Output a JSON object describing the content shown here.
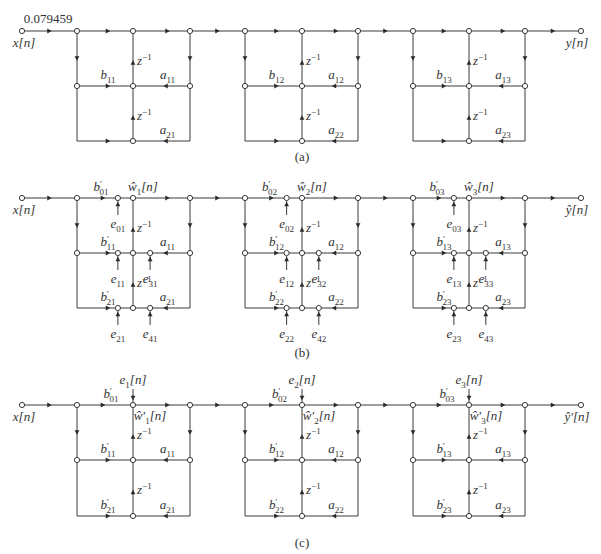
{
  "diagram": {
    "panels": [
      {
        "id": "a",
        "caption": "(a)",
        "input_label": "x[n]",
        "output_label": "y[n]",
        "gain_label": "0.079459",
        "delay_label": "z",
        "delay_exp": "−1",
        "sections": [
          {
            "b_top": null,
            "b1": {
              "base": "b",
              "sub": "11",
              "prime": false
            },
            "a1": {
              "base": "a",
              "sub": "11"
            },
            "b2": null,
            "a2": {
              "base": "a",
              "sub": "21"
            }
          },
          {
            "b_top": null,
            "b1": {
              "base": "b",
              "sub": "12",
              "prime": false
            },
            "a1": {
              "base": "a",
              "sub": "12"
            },
            "b2": null,
            "a2": {
              "base": "a",
              "sub": "22"
            }
          },
          {
            "b_top": null,
            "b1": {
              "base": "b",
              "sub": "13",
              "prime": false
            },
            "a1": {
              "base": "a",
              "sub": "13"
            },
            "b2": null,
            "a2": {
              "base": "a",
              "sub": "23"
            }
          }
        ]
      },
      {
        "id": "b",
        "caption": "(b)",
        "input_label": "x[n]",
        "output_label": "ŷ[n]",
        "delay_label": "z",
        "delay_exp": "−1",
        "sections": [
          {
            "b0": {
              "base": "b",
              "sub": "01",
              "prime": true
            },
            "w": {
              "base": "ŵ",
              "sub": "1",
              "suffix": "[n]"
            },
            "b1": {
              "base": "b",
              "sub": "11",
              "prime": true
            },
            "a1": {
              "base": "a",
              "sub": "11"
            },
            "b2": {
              "base": "b",
              "sub": "21",
              "prime": true
            },
            "a2": {
              "base": "a",
              "sub": "21"
            },
            "errors": {
              "e0": {
                "base": "e",
                "sub": "01"
              },
              "e1": {
                "base": "e",
                "sub": "11"
              },
              "e3": {
                "base": "e",
                "sub": "31"
              },
              "e2": {
                "base": "e",
                "sub": "21"
              },
              "e4": {
                "base": "e",
                "sub": "41"
              }
            }
          },
          {
            "b0": {
              "base": "b",
              "sub": "02",
              "prime": true
            },
            "w": {
              "base": "ŵ",
              "sub": "2",
              "suffix": "[n]"
            },
            "b1": {
              "base": "b",
              "sub": "12",
              "prime": true
            },
            "a1": {
              "base": "a",
              "sub": "12"
            },
            "b2": {
              "base": "b",
              "sub": "22",
              "prime": true
            },
            "a2": {
              "base": "a",
              "sub": "22"
            },
            "errors": {
              "e0": {
                "base": "e",
                "sub": "02"
              },
              "e1": {
                "base": "e",
                "sub": "12"
              },
              "e3": {
                "base": "e",
                "sub": "32"
              },
              "e2": {
                "base": "e",
                "sub": "22"
              },
              "e4": {
                "base": "e",
                "sub": "42"
              }
            }
          },
          {
            "b0": {
              "base": "b",
              "sub": "03",
              "prime": true
            },
            "w": {
              "base": "ŵ",
              "sub": "3",
              "suffix": "[n]"
            },
            "b1": {
              "base": "b",
              "sub": "13",
              "prime": true
            },
            "a1": {
              "base": "a",
              "sub": "13"
            },
            "b2": {
              "base": "b",
              "sub": "23",
              "prime": true
            },
            "a2": {
              "base": "a",
              "sub": "23"
            },
            "errors": {
              "e0": {
                "base": "e",
                "sub": "03"
              },
              "e1": {
                "base": "e",
                "sub": "13"
              },
              "e3": {
                "base": "e",
                "sub": "33"
              },
              "e2": {
                "base": "e",
                "sub": "23"
              },
              "e4": {
                "base": "e",
                "sub": "43"
              }
            }
          }
        ]
      },
      {
        "id": "c",
        "caption": "(c)",
        "input_label": "x[n]",
        "output_label": "ŷ′[n]",
        "delay_label": "z",
        "delay_exp": "−1",
        "sections": [
          {
            "e": {
              "base": "e",
              "sub": "1",
              "suffix": "[n]"
            },
            "b0": {
              "base": "b",
              "sub": "01",
              "prime": true
            },
            "w": {
              "base": "ŵ′",
              "sub": "1",
              "suffix": "[n]"
            },
            "b1": {
              "base": "b",
              "sub": "11",
              "prime": true
            },
            "a1": {
              "base": "a",
              "sub": "11"
            },
            "b2": {
              "base": "b",
              "sub": "21",
              "prime": true
            },
            "a2": {
              "base": "a",
              "sub": "21"
            }
          },
          {
            "e": {
              "base": "e",
              "sub": "2",
              "suffix": "[n]"
            },
            "b0": {
              "base": "b",
              "sub": "02",
              "prime": true
            },
            "w": {
              "base": "ŵ′",
              "sub": "2",
              "suffix": "[n]"
            },
            "b1": {
              "base": "b",
              "sub": "12",
              "prime": true
            },
            "a1": {
              "base": "a",
              "sub": "12"
            },
            "b2": {
              "base": "b",
              "sub": "22",
              "prime": true
            },
            "a2": {
              "base": "a",
              "sub": "22"
            }
          },
          {
            "e": {
              "base": "e",
              "sub": "3",
              "suffix": "[n]"
            },
            "b0": {
              "base": "b",
              "sub": "03",
              "prime": true
            },
            "w": {
              "base": "ŵ′",
              "sub": "3",
              "suffix": "[n]"
            },
            "b1": {
              "base": "b",
              "sub": "13",
              "prime": true
            },
            "a1": {
              "base": "a",
              "sub": "13"
            },
            "b2": {
              "base": "b",
              "sub": "23",
              "prime": true
            },
            "a2": {
              "base": "a",
              "sub": "23"
            }
          }
        ]
      }
    ]
  }
}
